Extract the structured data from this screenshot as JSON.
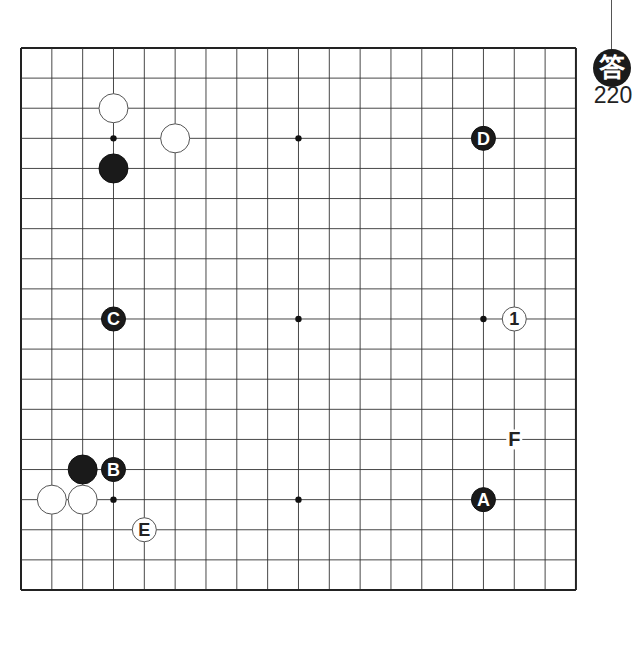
{
  "answer_badge": {
    "glyph": "答",
    "number": "220"
  },
  "board": {
    "size": 19,
    "origin": {
      "x": 21,
      "y": 48
    },
    "step": {
      "x": 30.83,
      "y": 30.11
    },
    "colors": {
      "line": "#333333",
      "border": "#222222",
      "black": "#1a1a1a",
      "white": "#ffffff"
    },
    "star_points": [
      [
        3,
        3
      ],
      [
        9,
        3
      ],
      [
        15,
        3
      ],
      [
        3,
        9
      ],
      [
        9,
        9
      ],
      [
        15,
        9
      ],
      [
        3,
        15
      ],
      [
        9,
        15
      ],
      [
        15,
        15
      ]
    ],
    "stones": [
      {
        "col": 3,
        "row": 2,
        "color": "white",
        "label": ""
      },
      {
        "col": 5,
        "row": 3,
        "color": "white",
        "label": ""
      },
      {
        "col": 3,
        "row": 4,
        "color": "black",
        "label": ""
      },
      {
        "col": 15,
        "row": 3,
        "color": "black",
        "label": "D"
      },
      {
        "col": 3,
        "row": 9,
        "color": "black",
        "label": "C"
      },
      {
        "col": 16,
        "row": 9,
        "color": "white",
        "label": "1"
      },
      {
        "col": 2,
        "row": 14,
        "color": "black",
        "label": ""
      },
      {
        "col": 3,
        "row": 14,
        "color": "black",
        "label": "B"
      },
      {
        "col": 1,
        "row": 15,
        "color": "white",
        "label": ""
      },
      {
        "col": 2,
        "row": 15,
        "color": "white",
        "label": ""
      },
      {
        "col": 4,
        "row": 16,
        "color": "white",
        "label": "E"
      },
      {
        "col": 15,
        "row": 15,
        "color": "black",
        "label": "A"
      }
    ],
    "marks": [
      {
        "col": 16,
        "row": 13,
        "label": "F"
      }
    ]
  }
}
